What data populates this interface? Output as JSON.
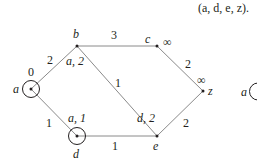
{
  "caption": "(a, d, e, z).",
  "nodes": [
    {
      "id": "a",
      "label": "a",
      "annotation": "0",
      "circled": true
    },
    {
      "id": "b",
      "label": "b",
      "annotation": "a, 2",
      "circled": false
    },
    {
      "id": "c",
      "label": "c",
      "annotation": "∞",
      "circled": false
    },
    {
      "id": "z",
      "label": "z",
      "annotation": "∞",
      "circled": false
    },
    {
      "id": "d",
      "label": "d",
      "annotation": "a, 1",
      "circled": true
    },
    {
      "id": "e",
      "label": "e",
      "annotation": "d, 2",
      "circled": false
    }
  ],
  "edges": [
    {
      "from": "a",
      "to": "b",
      "weight": "2"
    },
    {
      "from": "b",
      "to": "c",
      "weight": "3"
    },
    {
      "from": "c",
      "to": "z",
      "weight": "2"
    },
    {
      "from": "b",
      "to": "e",
      "weight": "1"
    },
    {
      "from": "a",
      "to": "d",
      "weight": "1"
    },
    {
      "from": "d",
      "to": "e",
      "weight": "1"
    },
    {
      "from": "e",
      "to": "z",
      "weight": "2"
    }
  ],
  "partial_next_graph": {
    "label": "a"
  }
}
